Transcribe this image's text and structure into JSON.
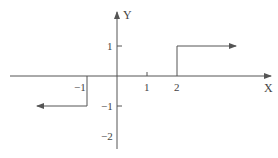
{
  "diagram": {
    "type": "step-function-graph",
    "axes": {
      "x_label": "X",
      "y_label": "Y",
      "x_ticks": [
        {
          "value": -1,
          "label": "−1"
        },
        {
          "value": 1,
          "label": "1"
        },
        {
          "value": 2,
          "label": "2"
        }
      ],
      "y_ticks": [
        {
          "value": 1,
          "label": "1"
        },
        {
          "value": -1,
          "label": "−1"
        },
        {
          "value": -2,
          "label": "−2"
        }
      ]
    },
    "segments": [
      {
        "name": "upper-step",
        "from_x": 2,
        "y": 1,
        "direction": "right",
        "vertical_from_y": 0
      },
      {
        "name": "lower-step",
        "from_x": -1,
        "y": -1,
        "direction": "left",
        "vertical_from_y": 0
      }
    ],
    "colors": {
      "line": "#555555",
      "text": "#444444"
    }
  }
}
